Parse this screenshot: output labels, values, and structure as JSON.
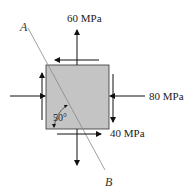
{
  "diagram": {
    "element": {
      "fill": "#c4c4c4",
      "stroke": "#333333"
    },
    "stresses": {
      "vertical_normal": {
        "label": "60 MPa",
        "direction": "tension"
      },
      "horizontal_normal": {
        "label": "80 MPa",
        "direction": "compression"
      },
      "shear": {
        "label": "40 MPa"
      }
    },
    "plane": {
      "start_label": "A",
      "end_label": "B",
      "angle_label": "50°",
      "line_color": "#777777"
    },
    "arrow_color": "#111111"
  }
}
